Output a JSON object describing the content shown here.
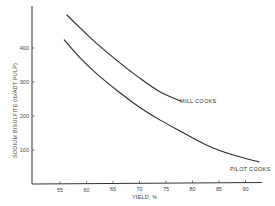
{
  "chart_data": {
    "type": "line",
    "title": "",
    "xlabel": "YIELD, %",
    "ylabel": "SODIUM BISULFITE (lb/ADT PULP)",
    "xlim": [
      50,
      93
    ],
    "ylim": [
      0,
      500
    ],
    "x_ticks": [
      55,
      60,
      65,
      70,
      75,
      80,
      85,
      90
    ],
    "y_ticks": [
      100,
      200,
      300,
      400
    ],
    "grid": false,
    "legend": "inline labels at curve ends",
    "series": [
      {
        "name": "MILL COOKS",
        "x": [
          56.3,
          58.8,
          62,
          66,
          70,
          73.9,
          77.8
        ],
        "y": [
          497,
          459,
          412,
          360,
          312,
          271,
          244
        ]
      },
      {
        "name": "PILOT COOKS",
        "x": [
          55.8,
          58.8,
          62,
          66,
          70,
          73.9,
          78,
          81.4,
          84,
          87.1,
          90,
          92.5
        ],
        "y": [
          424,
          371,
          323,
          272,
          226,
          188,
          153,
          124,
          105,
          88,
          75,
          65
        ]
      }
    ]
  },
  "labels": {
    "series_mill": "MILL COOKS",
    "series_pilot": "PILOT COOKS",
    "xlabel": "YIELD, %",
    "ylabel": "SODIUM BISULFITE (lb/ADT PULP)"
  }
}
